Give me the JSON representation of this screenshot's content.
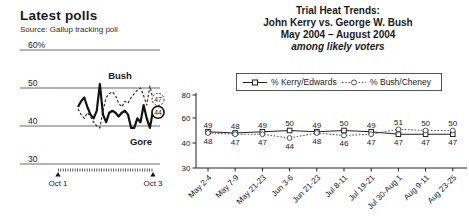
{
  "colors": {
    "ink": "#1a1a1a",
    "muted": "#555555",
    "background": "#ffffff"
  },
  "chart_data": [
    {
      "type": "line",
      "title": "Latest polls",
      "source": "Source: Gallup tracking poll",
      "ylim": [
        30,
        60
      ],
      "y_axis": {
        "ticks": [
          {
            "label": "60%",
            "value": 60
          },
          {
            "label": "50",
            "value": 50
          },
          {
            "label": "40",
            "value": 40
          },
          {
            "label": "30",
            "value": 30
          }
        ]
      },
      "x_axis_labels": [
        "Oct 1",
        "Oct 3"
      ],
      "series": [
        {
          "name": "Bush",
          "line": "dashed",
          "end_label": "47",
          "values": [
            44.5,
            43,
            42,
            43.5,
            42.5,
            41,
            40,
            39.5,
            44,
            47.5,
            48.5,
            49,
            48,
            46,
            45,
            46.5,
            46,
            47.5,
            48.5,
            49.5,
            50,
            48,
            45.5,
            50.5,
            47
          ]
        },
        {
          "name": "Gore",
          "line": "solid",
          "end_label": "44",
          "values": [
            45,
            46.5,
            47.5,
            45,
            43,
            42,
            44,
            51,
            43,
            41,
            43.5,
            44,
            43.5,
            42.5,
            43.5,
            44,
            43,
            39.5,
            39.5,
            42,
            41,
            45.5,
            42,
            39.5,
            44
          ]
        }
      ]
    },
    {
      "type": "line",
      "title_lines": [
        "Trial Heat Trends:",
        "John Kerry vs. George W. Bush",
        "May 2004 – August 2004",
        "among likely voters"
      ],
      "legend_position": "top",
      "ylim": [
        30,
        80
      ],
      "y_tick_labels": [
        "80",
        "60",
        "40",
        "30"
      ],
      "categories": [
        "May 2-4",
        "May 7-9",
        "May 21-23",
        "Jun 3-6",
        "Jun 21-23",
        "Jul 8-11",
        "Jul 19-21",
        "Jul 30-Aug 1",
        "Aug 9-11",
        "Aug 23-25"
      ],
      "series": [
        {
          "name": "% Kerry/Edwards",
          "marker": "square",
          "line": "solid",
          "values": [
            49,
            48,
            49,
            50,
            49,
            50,
            49,
            47,
            47,
            47
          ]
        },
        {
          "name": "% Bush/Cheney",
          "marker": "circle",
          "line": "dotted",
          "values": [
            48,
            47,
            47,
            44,
            48,
            46,
            47,
            51,
            50,
            50
          ]
        }
      ]
    }
  ]
}
